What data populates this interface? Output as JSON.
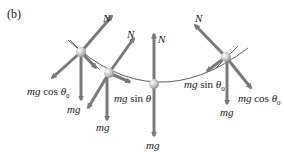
{
  "panel_label": "(b)",
  "colors": {
    "arrow": "#7a7a7a",
    "arc": "#333333",
    "ball": "#c8c8c8",
    "text": "#1a1a1a"
  },
  "positions": [
    {
      "name": "left-top",
      "labels": {
        "normal": "N",
        "gravity_component_perp": "mg cos θ0",
        "gravity": "mg"
      }
    },
    {
      "name": "left-mid",
      "labels": {
        "normal": "N",
        "gravity_component_tangent": "mg sin θ",
        "gravity": "mg"
      }
    },
    {
      "name": "bottom",
      "labels": {
        "normal": "N",
        "gravity": "mg"
      }
    },
    {
      "name": "right-top",
      "labels": {
        "normal": "N",
        "gravity_component_tangent": "mg sin θ0",
        "gravity_component_perp": "mg cos θ0",
        "gravity": "mg"
      }
    }
  ],
  "text": {
    "N": "N",
    "mg": "mg",
    "mg_cos": "mg cos θ",
    "mg_sin": "mg sin θ",
    "sub0": "0"
  }
}
